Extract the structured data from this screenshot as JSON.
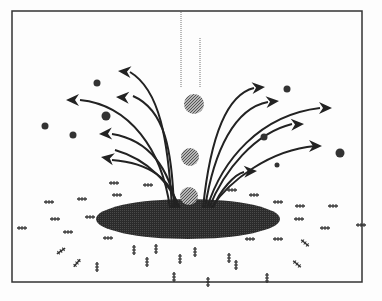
{
  "diagram": {
    "colors": {
      "background": "#fdfdfd",
      "frame": "#333333",
      "pool": "#2a2a2a",
      "droplet": "#8a8a8a",
      "arrow": "#222222",
      "particle": "#333333"
    },
    "elements": {
      "frame": "border",
      "pool": "dark ellipse",
      "droplets": 3,
      "fall_lines": 2,
      "left_arrows": 6,
      "right_arrows": 6,
      "airborne_dots": 9,
      "ground_particles": 36
    }
  }
}
